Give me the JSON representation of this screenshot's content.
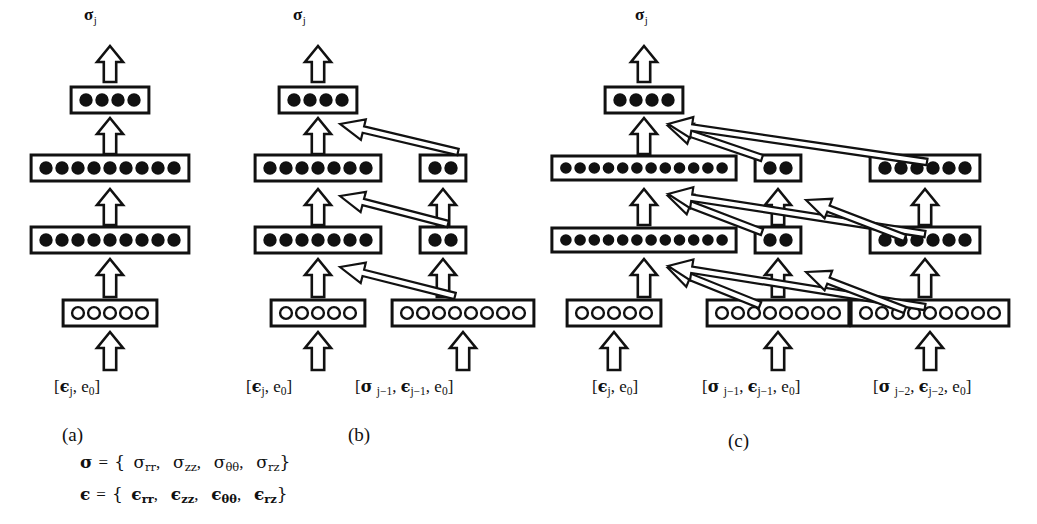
{
  "figure": {
    "type": "neural-network-architecture-diagram",
    "background": "#ffffff",
    "ink": "#111111"
  },
  "panels": [
    {
      "id": "a",
      "caption": "(a)",
      "output_label": {
        "symbol": "σ",
        "subscript": "j"
      },
      "columns": [
        {
          "name": "main-column",
          "input_label": {
            "open": "[",
            "sym1": "ϵ",
            "sub1": "j",
            "sep": ", ",
            "sym2": "e",
            "sub2": "0",
            "close": "]"
          },
          "layers": [
            {
              "role": "input-layer",
              "units": 5,
              "node_style": "hollow"
            },
            {
              "role": "hidden-layer-1",
              "units": 9,
              "node_style": "filled"
            },
            {
              "role": "hidden-layer-2",
              "units": 9,
              "node_style": "filled"
            },
            {
              "role": "output-layer",
              "units": 4,
              "node_style": "filled"
            }
          ]
        }
      ]
    },
    {
      "id": "b",
      "caption": "(b)",
      "output_label": {
        "symbol": "σ",
        "subscript": "j"
      },
      "columns": [
        {
          "name": "main-column",
          "input_label": {
            "open": "[",
            "sym1": "ϵ",
            "sub1": "j",
            "sep": ", ",
            "sym2": "e",
            "sub2": "0",
            "close": "]"
          },
          "layers": [
            {
              "role": "input-layer",
              "units": 5,
              "node_style": "hollow"
            },
            {
              "role": "hidden-layer-1",
              "units": 7,
              "node_style": "filled"
            },
            {
              "role": "hidden-layer-2",
              "units": 7,
              "node_style": "filled"
            },
            {
              "role": "output-layer",
              "units": 4,
              "node_style": "filled"
            }
          ]
        },
        {
          "name": "recurrent-column-1",
          "input_label": {
            "open": "[",
            "sym1": "σ",
            "sub1": "j−1",
            "sep": ", ",
            "sym2": "ϵ",
            "sub2": "j−1",
            "sep2": ", ",
            "sym3": "e",
            "sub3": "0",
            "close": "]"
          },
          "layers": [
            {
              "role": "input-layer",
              "units": 8,
              "node_style": "hollow"
            },
            {
              "role": "hidden-layer-1",
              "units": 2,
              "node_style": "filled"
            },
            {
              "role": "hidden-layer-2",
              "units": 2,
              "node_style": "filled"
            }
          ]
        }
      ],
      "skip_connections": 3
    },
    {
      "id": "c",
      "caption": "(c)",
      "output_label": {
        "symbol": "σ",
        "subscript": "j"
      },
      "columns": [
        {
          "name": "main-column",
          "input_label": {
            "open": "[",
            "sym1": "ϵ",
            "sub1": "j",
            "sep": ", ",
            "sym2": "e",
            "sub2": "0",
            "close": "]"
          },
          "layers": [
            {
              "role": "input-layer",
              "units": 5,
              "node_style": "hollow"
            },
            {
              "role": "hidden-layer-1",
              "units": 12,
              "node_style": "filled"
            },
            {
              "role": "hidden-layer-2",
              "units": 12,
              "node_style": "filled"
            },
            {
              "role": "output-layer",
              "units": 4,
              "node_style": "filled"
            }
          ]
        },
        {
          "name": "recurrent-column-1",
          "input_label": {
            "open": "[",
            "sym1": "σ",
            "sub1": "j−1",
            "sep": ", ",
            "sym2": "ϵ",
            "sub2": "j−1",
            "sep2": ", ",
            "sym3": "e",
            "sub3": "0",
            "close": "]"
          },
          "layers": [
            {
              "role": "input-layer",
              "units": 8,
              "node_style": "hollow"
            },
            {
              "role": "hidden-layer-1",
              "units": 2,
              "node_style": "filled"
            },
            {
              "role": "hidden-layer-2",
              "units": 2,
              "node_style": "filled"
            }
          ]
        },
        {
          "name": "recurrent-column-2",
          "input_label": {
            "open": "[",
            "sym1": "σ",
            "sub1": "j−2",
            "sep": ", ",
            "sym2": "ϵ",
            "sub2": "j−2",
            "sep2": ", ",
            "sym3": "e",
            "sub3": "0",
            "close": "]"
          },
          "layers": [
            {
              "role": "input-layer",
              "units": 9,
              "node_style": "hollow"
            },
            {
              "role": "hidden-layer-1",
              "units": 6,
              "node_style": "filled"
            },
            {
              "role": "hidden-layer-2",
              "units": 6,
              "node_style": "filled"
            }
          ]
        }
      ],
      "skip_connections": 6
    }
  ],
  "legend": {
    "line1": {
      "lhs": "σ",
      "eq": "=",
      "open": "{",
      "terms": [
        "σrr",
        "σzz",
        "σθθ",
        "σrz"
      ],
      "close": "}",
      "components": [
        {
          "sym": "σ",
          "sub": "rr"
        },
        {
          "sym": "σ",
          "sub": "zz"
        },
        {
          "sym": "σ",
          "sub": "θθ"
        },
        {
          "sym": "σ",
          "sub": "rz"
        }
      ]
    },
    "line2": {
      "lhs": "ϵ",
      "eq": "=",
      "open": "{",
      "terms": [
        "ϵrr",
        "ϵzz",
        "ϵθθ",
        "ϵrz"
      ],
      "close": "}",
      "components": [
        {
          "sym": "ϵ",
          "sub": "rr"
        },
        {
          "sym": "ϵ",
          "sub": "zz"
        },
        {
          "sym": "ϵ",
          "sub": "θθ"
        },
        {
          "sym": "ϵ",
          "sub": "rz"
        }
      ]
    }
  }
}
